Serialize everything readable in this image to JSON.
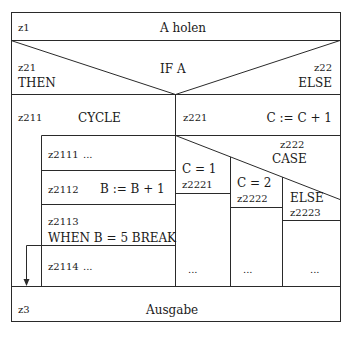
{
  "diagram": {
    "type": "Nassi-Shneiderman structogram",
    "blocks": {
      "z1": {
        "id": "z1",
        "text": "A holen"
      },
      "if": {
        "text": "IF A",
        "then_id": "z21",
        "then_label": "THEN",
        "else_id": "z22",
        "else_label": "ELSE"
      },
      "cycle": {
        "id": "z211",
        "text": "CYCLE"
      },
      "assign_c": {
        "id": "z221",
        "text": "C := C + 1"
      },
      "loop_body": [
        {
          "id": "z2111",
          "text": "..."
        },
        {
          "id": "z2112",
          "text": "B := B + 1"
        },
        {
          "id": "z2113",
          "text": "WHEN B = 5 BREAK"
        },
        {
          "id": "z2114",
          "text": "..."
        }
      ],
      "case": {
        "id": "z222",
        "text": "CASE",
        "branches": [
          {
            "label": "C = 1",
            "id": "z2221",
            "body": "..."
          },
          {
            "label": "C = 2",
            "id": "z2222",
            "body": "..."
          },
          {
            "label": "ELSE",
            "id": "z2223",
            "body": "..."
          }
        ]
      },
      "z3": {
        "id": "z3",
        "text": "Ausgabe"
      }
    },
    "colors": {
      "line": "#2a2a2a",
      "background": "#ffffff"
    }
  }
}
